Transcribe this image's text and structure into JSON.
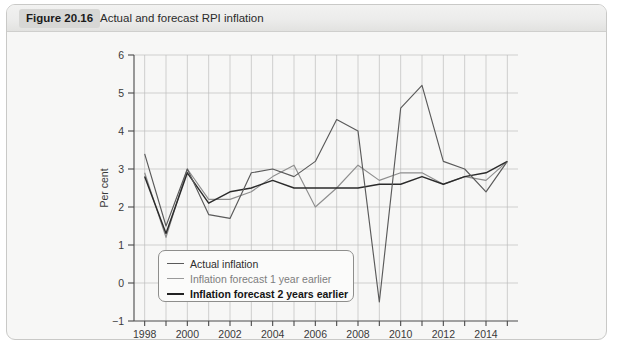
{
  "figure": {
    "badge": "Figure 20.16",
    "title": "Actual and forecast RPI inflation"
  },
  "legend": {
    "actual": "Actual inflation",
    "forecast1": "Inflation forecast 1 year earlier",
    "forecast2": "Inflation forecast 2 years earlier"
  },
  "colors": {
    "actual": "#5a5a5a",
    "forecast1": "#8e8e8e",
    "forecast2": "#2b2b2b",
    "grid": "#bdbdbd",
    "axis": "#4a4a4a",
    "panel": "#f7f7f6",
    "header": "#e8e8e6",
    "badge": "#d7d7d5"
  },
  "chart_data": {
    "type": "line",
    "title": "Actual and forecast RPI inflation",
    "xlabel": "",
    "ylabel": "Per cent",
    "xlim": [
      1997.5,
      2015.5
    ],
    "ylim": [
      -1,
      6
    ],
    "yticks": [
      -1,
      0,
      1,
      2,
      3,
      4,
      5,
      6
    ],
    "ytick_labels": [
      "−1",
      "0",
      "1",
      "2",
      "3",
      "4",
      "5",
      "6"
    ],
    "xticks": [
      1998,
      1999,
      2000,
      2001,
      2002,
      2003,
      2004,
      2005,
      2006,
      2007,
      2008,
      2009,
      2010,
      2011,
      2012,
      2013,
      2014,
      2015
    ],
    "xtick_labels_shown": [
      1998,
      2000,
      2002,
      2004,
      2006,
      2008,
      2010,
      2012,
      2014
    ],
    "grid": true,
    "legend_position": "lower-left-inside",
    "x": [
      1998,
      1999,
      2000,
      2001,
      2002,
      2003,
      2004,
      2005,
      2006,
      2007,
      2008,
      2009,
      2010,
      2011,
      2012,
      2013,
      2014,
      2015
    ],
    "series": [
      {
        "name": "Actual inflation",
        "color": "#5a5a5a",
        "values": [
          3.4,
          1.5,
          3.0,
          1.8,
          1.7,
          2.9,
          3.0,
          2.8,
          3.2,
          4.3,
          4.0,
          -0.5,
          4.6,
          5.2,
          3.2,
          3.0,
          2.4,
          3.2
        ]
      },
      {
        "name": "Inflation forecast 1 year earlier",
        "color": "#8e8e8e",
        "values": [
          2.9,
          1.2,
          3.0,
          2.2,
          2.2,
          2.4,
          2.8,
          3.1,
          2.0,
          2.5,
          3.1,
          2.7,
          2.9,
          2.9,
          2.6,
          2.8,
          2.7,
          3.2
        ]
      },
      {
        "name": "Inflation forecast 2 years earlier",
        "color": "#2b2b2b",
        "values": [
          2.8,
          1.3,
          2.9,
          2.1,
          2.4,
          2.5,
          2.7,
          2.5,
          2.5,
          2.5,
          2.5,
          2.6,
          2.6,
          2.8,
          2.6,
          2.8,
          2.9,
          3.2
        ]
      }
    ]
  }
}
